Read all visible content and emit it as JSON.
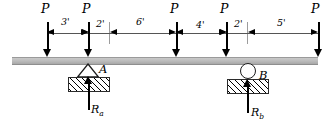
{
  "diagram": {
    "type": "free-body-diagram",
    "beam": {
      "x": 12,
      "y": 57,
      "width": 306,
      "height": 6,
      "color": "#bdbdbd"
    },
    "loads": [
      {
        "label": "P",
        "x": 47,
        "label_x": 41,
        "label_y": 3
      },
      {
        "label": "P",
        "x": 88,
        "label_x": 82,
        "label_y": 3
      },
      {
        "label": "P",
        "x": 176,
        "label_x": 170,
        "label_y": 3
      },
      {
        "label": "P",
        "x": 226,
        "label_x": 220,
        "label_y": 3
      },
      {
        "label": "P",
        "x": 318,
        "label_x": 311,
        "label_y": 3
      }
    ],
    "dimensions": [
      {
        "label": "3'",
        "from": 47,
        "to": 88,
        "label_x": 61,
        "label_y": 17
      },
      {
        "label": "2'",
        "from": 88,
        "to": 109,
        "label_x": 96,
        "label_y": 19
      },
      {
        "label": "6'",
        "from": 109,
        "to": 176,
        "label_x": 136,
        "label_y": 17
      },
      {
        "label": "4'",
        "from": 176,
        "to": 226,
        "label_x": 196,
        "label_y": 20
      },
      {
        "label": "2'",
        "from": 226,
        "to": 247,
        "label_x": 234,
        "label_y": 19
      },
      {
        "label": "5'",
        "from": 247,
        "to": 318,
        "label_x": 277,
        "label_y": 18
      }
    ],
    "extension_lines": [
      {
        "x": 109,
        "y": 22,
        "height": 22
      },
      {
        "x": 247,
        "y": 22,
        "height": 22
      }
    ],
    "supports": [
      {
        "id": "A",
        "kind": "pin",
        "label": "A",
        "label_x": 99,
        "label_y": 64,
        "x": 88,
        "reaction": {
          "label": "R",
          "subscript": "a",
          "label_x": 91,
          "label_y": 104
        }
      },
      {
        "id": "B",
        "kind": "roller",
        "label": "B",
        "label_x": 259,
        "label_y": 70,
        "x": 247,
        "reaction": {
          "label": "R",
          "subscript": "b",
          "label_x": 251,
          "label_y": 107
        }
      }
    ],
    "colors": {
      "beam": "#bdbdbd",
      "arrow": "#000000",
      "dimension_line": "#555555",
      "extension_line": "#9c9c9c",
      "ground_outline": "#2b2b2b"
    }
  }
}
